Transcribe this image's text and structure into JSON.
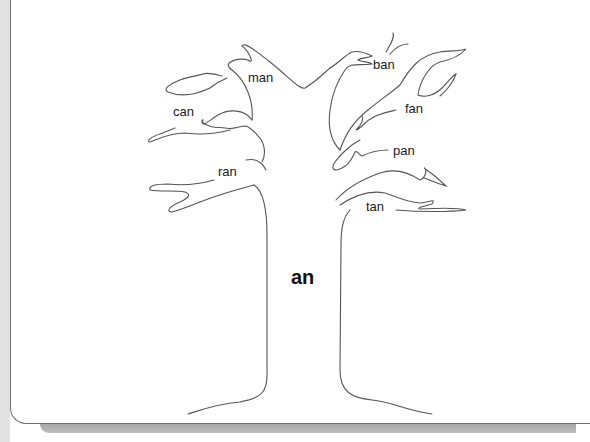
{
  "worksheet": {
    "word_family": "an",
    "instructions_clipped": "",
    "words": [
      {
        "text": "man",
        "x": 248,
        "y": 70
      },
      {
        "text": "ban",
        "x": 373,
        "y": 57
      },
      {
        "text": "can",
        "x": 173,
        "y": 104
      },
      {
        "text": "fan",
        "x": 405,
        "y": 101
      },
      {
        "text": "pan",
        "x": 393,
        "y": 143
      },
      {
        "text": "ran",
        "x": 218,
        "y": 164
      },
      {
        "text": "tan",
        "x": 366,
        "y": 199
      }
    ]
  },
  "colors": {
    "line": "#555555",
    "text": "#1a1a1a",
    "shadow": "#b0b0b0",
    "strip": "#e2e2e2"
  }
}
